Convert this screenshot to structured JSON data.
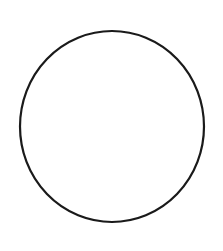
{
  "figure": {
    "shape": "circle",
    "background_color": "#ffffff",
    "stroke_color": "#1a1a1a",
    "fill_color": "none",
    "stroke_width": 2.2,
    "center": {
      "x": 112,
      "y": 126.5
    },
    "radius_x": 92,
    "radius_y": 95.5
  }
}
